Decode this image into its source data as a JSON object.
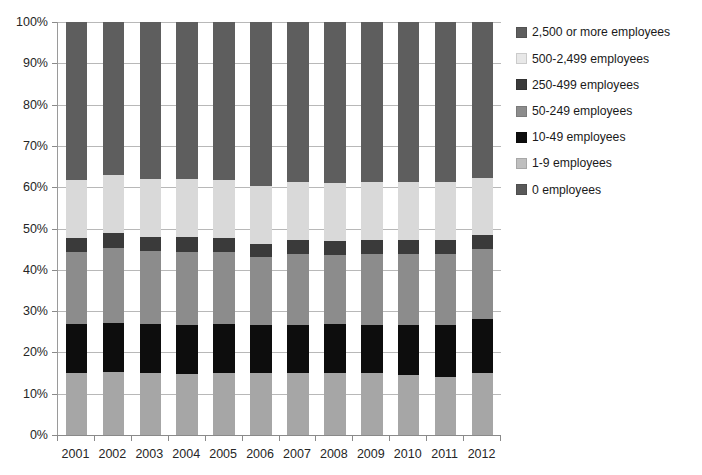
{
  "chart_data": {
    "type": "bar",
    "stacked": true,
    "title": "",
    "subtitle": "",
    "xlabel": "",
    "ylabel": "",
    "ylim": [
      0,
      100
    ],
    "ytick_labels": [
      "0%",
      "10%",
      "20%",
      "30%",
      "40%",
      "50%",
      "60%",
      "70%",
      "80%",
      "90%",
      "100%"
    ],
    "ytick_values": [
      0,
      10,
      20,
      30,
      40,
      50,
      60,
      70,
      80,
      90,
      100
    ],
    "grid": true,
    "legend_position": "right",
    "categories": [
      "2001",
      "2002",
      "2003",
      "2004",
      "2005",
      "2006",
      "2007",
      "2008",
      "2009",
      "2010",
      "2011",
      "2012"
    ],
    "series": [
      {
        "name": "0 employees",
        "color": "#595959",
        "values": [
          0,
          0,
          0,
          0,
          0,
          0,
          0,
          0,
          0,
          0,
          0,
          0
        ]
      },
      {
        "name": "1-9 employees",
        "color": "#a6a6a6",
        "values": [
          15.0,
          15.2,
          15.0,
          14.8,
          14.9,
          15.1,
          14.9,
          15.0,
          14.9,
          14.6,
          14.0,
          15.0
        ]
      },
      {
        "name": "10-49 employees",
        "color": "#0d0d0d",
        "values": [
          12.0,
          12.0,
          12.0,
          11.9,
          12.0,
          11.5,
          11.8,
          11.8,
          11.8,
          12.0,
          12.6,
          13.0
        ]
      },
      {
        "name": "50-249 employees",
        "color": "#8c8c8c",
        "values": [
          17.3,
          18.0,
          17.6,
          17.6,
          17.5,
          16.6,
          17.2,
          16.8,
          17.1,
          17.2,
          17.2,
          17.0
        ]
      },
      {
        "name": "250-499 employees",
        "color": "#3a3a3a",
        "values": [
          3.4,
          3.6,
          3.4,
          3.6,
          3.4,
          3.1,
          3.4,
          3.4,
          3.4,
          3.4,
          3.3,
          3.5
        ]
      },
      {
        "name": "500-2,499 employees",
        "color": "#d9d9d9",
        "values": [
          14.0,
          14.2,
          14.0,
          14.1,
          14.0,
          14.1,
          14.0,
          14.0,
          14.1,
          14.1,
          14.2,
          13.7
        ]
      },
      {
        "name": "2,500 or more employees",
        "color": "#5e5e5e",
        "values": [
          38.3,
          37.0,
          38.0,
          38.0,
          38.2,
          39.6,
          38.7,
          39.0,
          38.7,
          38.7,
          38.7,
          37.8
        ]
      }
    ]
  },
  "legend": {
    "items": [
      {
        "label": "2,500 or more employees",
        "color": "#5e5e5e"
      },
      {
        "label": "500-2,499 employees",
        "color": "#e8e8e8"
      },
      {
        "label": "250-499 employees",
        "color": "#3a3a3a"
      },
      {
        "label": "50-249 employees",
        "color": "#8c8c8c"
      },
      {
        "label": "10-49 employees",
        "color": "#0d0d0d"
      },
      {
        "label": "1-9 employees",
        "color": "#bfbfbf"
      },
      {
        "label": "0 employees",
        "color": "#595959"
      }
    ]
  },
  "axes": {
    "y_min_label": "0%",
    "y_max_label": "100%"
  }
}
